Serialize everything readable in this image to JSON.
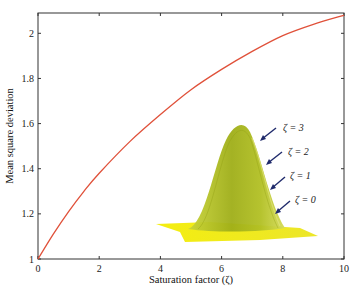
{
  "chart_data": {
    "type": "line",
    "title": "",
    "xlabel": "Saturation factor (ζ)",
    "ylabel": "Mean square deviation",
    "xlim": [
      0,
      10
    ],
    "ylim": [
      1,
      2.09
    ],
    "xticks": [
      0,
      2,
      4,
      6,
      8,
      10
    ],
    "yticks": [
      1,
      1.2,
      1.4,
      1.6,
      1.8,
      2
    ],
    "xtick_labels": [
      "0",
      "2",
      "4",
      "6",
      "8",
      "10"
    ],
    "ytick_labels": [
      "1",
      "1.2",
      "1.4",
      "1.6",
      "1.8",
      "2"
    ],
    "grid": false,
    "legend": null,
    "series": [
      {
        "name": "Mean square deviation",
        "color": "#e0513a",
        "x": [
          0,
          0.5,
          1,
          1.5,
          2,
          3,
          4,
          5,
          6,
          7,
          8,
          9,
          10
        ],
        "y": [
          1.0,
          1.11,
          1.21,
          1.3,
          1.38,
          1.52,
          1.64,
          1.75,
          1.84,
          1.92,
          1.99,
          2.04,
          2.08
        ]
      }
    ],
    "inset": {
      "description": "3D surface of Gaussian-like peaks, yellow-green",
      "color_peak": "#a3b51c",
      "color_base": "#f2ef1a",
      "annotations": [
        {
          "label": "ζ = 3"
        },
        {
          "label": "ζ = 2"
        },
        {
          "label": "ζ = 1"
        },
        {
          "label": "ζ = 0"
        }
      ],
      "arrow_color": "#1f2a6b"
    }
  }
}
